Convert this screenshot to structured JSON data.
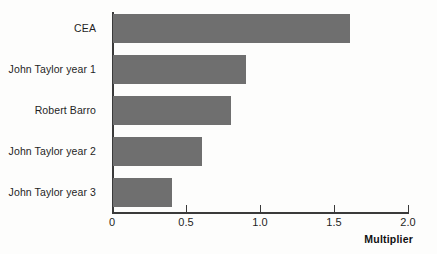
{
  "chart_data": {
    "type": "bar",
    "orientation": "horizontal",
    "title": "",
    "subtitle": "",
    "xlabel": "Multiplier",
    "ylabel": "",
    "categories": [
      "CEA",
      "John Taylor year 1",
      "Robert Barro",
      "John Taylor year 2",
      "John Taylor year 3"
    ],
    "values": [
      1.6,
      0.9,
      0.8,
      0.6,
      0.4
    ],
    "xlim": [
      0,
      2.0
    ],
    "xticks": [
      0,
      0.5,
      1.0,
      1.5,
      2.0
    ],
    "xtick_labels": [
      "0",
      "0.5",
      "1.0",
      "1.5",
      "2.0"
    ],
    "grid": false,
    "legend": null,
    "bar_color": "#6f6f6f",
    "axis_color": "#3a3a3a",
    "background_color": "#fdfdfc"
  },
  "bars": [
    {
      "label": "CEA",
      "value": 1.6
    },
    {
      "label": "John Taylor year 1",
      "value": 0.9
    },
    {
      "label": "Robert Barro",
      "value": 0.8
    },
    {
      "label": "John Taylor year 2",
      "value": 0.6
    },
    {
      "label": "John Taylor year 3",
      "value": 0.4
    }
  ],
  "ticks": [
    {
      "label": "0",
      "value": 0
    },
    {
      "label": "0.5",
      "value": 0.5
    },
    {
      "label": "1.0",
      "value": 1.0
    },
    {
      "label": "1.5",
      "value": 1.5
    },
    {
      "label": "2.0",
      "value": 2.0
    }
  ],
  "axis": {
    "x_title": "Multiplier"
  }
}
